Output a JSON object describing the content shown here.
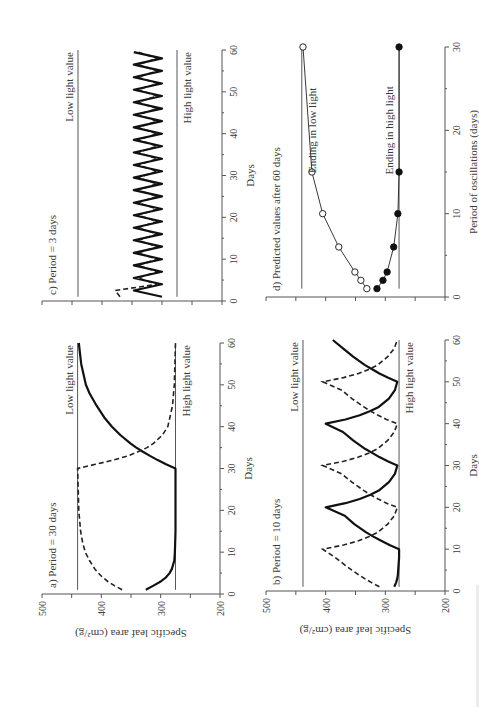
{
  "figure": {
    "rotation_deg": -90,
    "y_axis_label": "Specific leaf area (cm²/g)",
    "x_axis_label_days": "Days",
    "x_axis_label_period": "Period of oscillations (days)"
  },
  "chart_data": [
    {
      "id": "a",
      "type": "line",
      "title": "a) Period = 30 days",
      "xlabel": "Days",
      "ylabel": "Specific leaf area (cm²/g)",
      "xlim": [
        0,
        60
      ],
      "ylim": [
        200,
        500
      ],
      "xticks": [
        0,
        10,
        20,
        30,
        40,
        50,
        60
      ],
      "yticks": [
        200,
        300,
        400,
        500
      ],
      "reference_lines": [
        {
          "label": "Low light value",
          "y": 440
        },
        {
          "label": "High light value",
          "y": 275
        }
      ],
      "series": [
        {
          "name": "solid",
          "style": "solid",
          "x": [
            1,
            2,
            3,
            4,
            5,
            6,
            8,
            10,
            15,
            20,
            25,
            30,
            31,
            32,
            33,
            34,
            35,
            36,
            38,
            40,
            42,
            45,
            48,
            50,
            55,
            60
          ],
          "y": [
            325,
            312,
            300,
            291,
            285,
            281,
            277,
            276,
            275,
            275,
            275,
            275,
            291,
            305,
            318,
            330,
            341,
            351,
            368,
            382,
            394,
            408,
            420,
            426,
            434,
            438
          ]
        },
        {
          "name": "dashed",
          "style": "dashed",
          "x": [
            1,
            2,
            3,
            4,
            5,
            6,
            8,
            10,
            12,
            15,
            20,
            25,
            30,
            31,
            32,
            33,
            34,
            35,
            36,
            38,
            40,
            45,
            50,
            55,
            60
          ],
          "y": [
            365,
            378,
            389,
            398,
            405,
            411,
            420,
            427,
            431,
            435,
            438,
            439,
            440,
            410,
            380,
            355,
            338,
            323,
            312,
            297,
            288,
            280,
            277,
            276,
            275
          ]
        }
      ]
    },
    {
      "id": "b",
      "type": "line",
      "title": "b) Period = 10 days",
      "xlabel": "Days",
      "ylabel": "Specific leaf area (cm²/g)",
      "xlim": [
        0,
        60
      ],
      "ylim": [
        200,
        500
      ],
      "xticks": [
        0,
        10,
        20,
        30,
        40,
        50,
        60
      ],
      "yticks": [
        200,
        300,
        400,
        500
      ],
      "reference_lines": [
        {
          "label": "Low light value",
          "y": 438
        },
        {
          "label": "High light value",
          "y": 277
        }
      ],
      "series": [
        {
          "name": "solid",
          "style": "solid",
          "x": [
            1,
            2,
            3,
            4,
            6,
            8,
            10,
            11,
            12,
            13,
            14,
            16,
            18,
            20,
            21,
            22,
            23,
            24,
            26,
            28,
            30,
            31,
            32,
            33,
            34,
            36,
            38,
            40,
            41,
            42,
            43,
            44,
            46,
            48,
            50,
            51,
            52,
            53,
            54,
            56,
            58,
            60
          ],
          "y": [
            285,
            282,
            280,
            279,
            278,
            277,
            277,
            293,
            307,
            320,
            332,
            352,
            368,
            400,
            367,
            343,
            325,
            311,
            294,
            284,
            280,
            296,
            310,
            322,
            334,
            354,
            371,
            400,
            367,
            343,
            325,
            311,
            294,
            284,
            280,
            296,
            310,
            322,
            334,
            354,
            371,
            388
          ]
        },
        {
          "name": "dashed",
          "style": "dashed",
          "x": [
            1,
            2,
            3,
            4,
            5,
            6,
            8,
            10,
            11,
            12,
            13,
            14,
            16,
            18,
            20,
            21,
            22,
            23,
            24,
            26,
            28,
            30,
            31,
            32,
            33,
            34,
            36,
            38,
            40,
            41,
            42,
            43,
            44,
            46,
            48,
            50,
            51,
            52,
            53,
            54,
            56,
            58,
            60
          ],
          "y": [
            310,
            323,
            335,
            346,
            356,
            366,
            384,
            405,
            370,
            345,
            327,
            313,
            296,
            285,
            280,
            298,
            312,
            325,
            336,
            356,
            373,
            405,
            370,
            345,
            327,
            313,
            296,
            285,
            280,
            298,
            312,
            325,
            336,
            356,
            373,
            405,
            370,
            345,
            327,
            313,
            296,
            285,
            280
          ]
        }
      ]
    },
    {
      "id": "c",
      "type": "line",
      "title": "c) Period = 3 days",
      "xlabel": "Days",
      "ylabel": "Specific leaf area (cm²/g)",
      "xlim": [
        0,
        60
      ],
      "ylim": [
        200,
        500
      ],
      "xticks": [
        0,
        10,
        20,
        30,
        40,
        50,
        60
      ],
      "yticks": [
        200,
        300,
        400,
        500
      ],
      "reference_lines": [
        {
          "label": "Low light value",
          "y": 440
        },
        {
          "label": "High light value",
          "y": 275
        }
      ],
      "oscillation": {
        "period_days": 3,
        "solid_range": [
          300,
          347
        ],
        "dashed_range": [
          308,
          340
        ],
        "dashed_start": 378
      }
    },
    {
      "id": "d",
      "type": "line",
      "title": "d) Predicted values after 60 days",
      "xlabel": "Period of oscillations (days)",
      "ylabel": "Specific leaf area (cm²/g)",
      "xlim": [
        0,
        30
      ],
      "ylim": [
        200,
        500
      ],
      "xticks": [
        0,
        10,
        20,
        30
      ],
      "yticks": [
        200,
        250,
        300,
        350,
        400,
        450,
        500
      ],
      "reference_lines": [
        {
          "label": "",
          "y": 440
        },
        {
          "label": "",
          "y": 277
        }
      ],
      "series": [
        {
          "name": "Ending in low light",
          "marker": "open-circle",
          "x": [
            1,
            2,
            3,
            6,
            10,
            15,
            30
          ],
          "y": [
            331,
            341,
            351,
            378,
            405,
            423,
            438
          ]
        },
        {
          "name": "Ending in high light",
          "marker": "filled-circle",
          "x": [
            1,
            2,
            3,
            6,
            10,
            15,
            30
          ],
          "y": [
            314,
            304,
            297,
            286,
            279,
            277,
            277
          ]
        }
      ]
    }
  ]
}
